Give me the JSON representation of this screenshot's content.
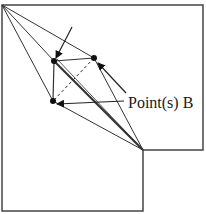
{
  "diagram": {
    "label": "Point(s) B",
    "colors": {
      "stroke": "#333333",
      "point": "#111111",
      "background": "#ffffff"
    },
    "outline": [
      [
        2,
        5
      ],
      [
        203,
        5
      ],
      [
        203,
        150
      ],
      [
        143,
        150
      ],
      [
        143,
        211
      ],
      [
        2,
        211
      ]
    ],
    "corner_a": [
      2,
      5
    ],
    "corner_c": [
      143,
      150
    ],
    "points_b": [
      {
        "id": "p1",
        "x": 54,
        "y": 61
      },
      {
        "id": "p2",
        "x": 94,
        "y": 58
      },
      {
        "id": "p3",
        "x": 53,
        "y": 101
      }
    ],
    "arrows": [
      {
        "from": [
          72,
          27
        ],
        "to": [
          56,
          58
        ]
      },
      {
        "from": [
          126,
          93
        ],
        "to": [
          98,
          63
        ]
      },
      {
        "from": [
          124,
          101
        ],
        "to": [
          57,
          104
        ]
      }
    ]
  }
}
